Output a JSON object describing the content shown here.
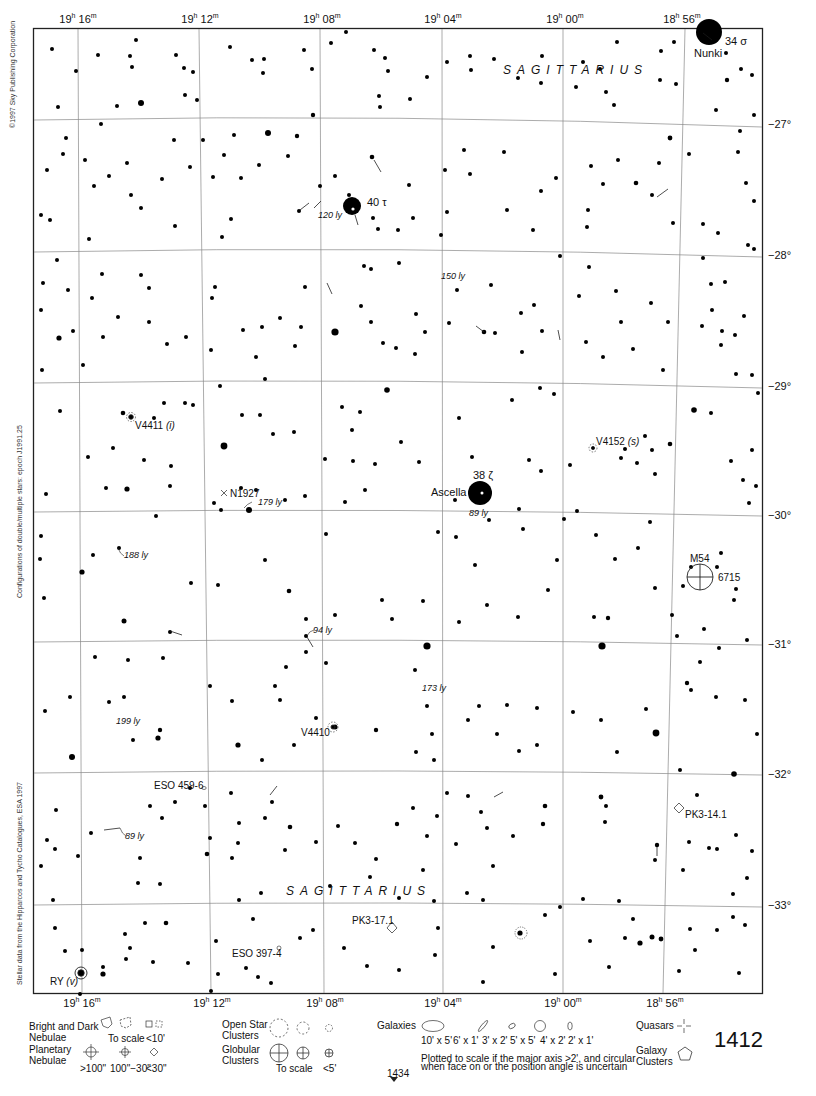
{
  "page": {
    "number": "1412",
    "next_page_ref": "1434"
  },
  "side_notes": {
    "copyright": "©1997 Sky Publishing Corporation",
    "epoch": "Configurations of double/multiple stars: epoch J1991.25",
    "source": "Stellar data from the Hipparcos and Tycho Catalogues, ESA 1997"
  },
  "axes": {
    "ra_top": [
      {
        "h": "19",
        "m": "16",
        "x": 78
      },
      {
        "h": "19",
        "m": "12",
        "x": 200
      },
      {
        "h": "19",
        "m": "08",
        "x": 320
      },
      {
        "h": "19",
        "m": "04",
        "x": 442
      },
      {
        "h": "19",
        "m": "00",
        "x": 563
      },
      {
        "h": "18",
        "m": "56",
        "x": 685
      }
    ],
    "ra_bottom": [
      {
        "h": "19",
        "m": "16",
        "x": 80
      },
      {
        "h": "19",
        "m": "12",
        "x": 210
      },
      {
        "h": "19",
        "m": "08",
        "x": 323
      },
      {
        "h": "19",
        "m": "04",
        "x": 443
      },
      {
        "h": "19",
        "m": "00",
        "x": 563
      },
      {
        "h": "18",
        "m": "56",
        "x": 663
      }
    ],
    "dec": [
      {
        "label": "−27°",
        "y": 126
      },
      {
        "label": "−28°",
        "y": 256
      },
      {
        "label": "−29°",
        "y": 387
      },
      {
        "label": "−30°",
        "y": 516
      },
      {
        "label": "−31°",
        "y": 645
      },
      {
        "label": "−32°",
        "y": 775
      },
      {
        "label": "−33°",
        "y": 906
      }
    ]
  },
  "constellation": {
    "name_top": "SAGITTARIUS",
    "name_bottom": "SAGITTARIUS"
  },
  "labels": {
    "nunki": "Nunki",
    "sigma": "34 σ",
    "tau": "40 τ",
    "zeta": "38 ζ",
    "ascella": "Ascella",
    "ly_120": "120 ly",
    "ly_150": "150 ly",
    "ly_89a": "89 ly",
    "ly_179": "179 ly",
    "ly_188": "188 ly",
    "ly_94": "94 ly",
    "ly_173": "173 ly",
    "ly_199": "199 ly",
    "ly_89b": "89 ly",
    "v4411": "V4411",
    "v4411_type": "(i)",
    "v4152": "V4152",
    "v4152_type": "(s)",
    "n1927": "N1927",
    "m54": "M54",
    "ngc6715": "6715",
    "v4410": "V4410",
    "eso459": "ESO 459-6",
    "pk3_14": "PK3-14.1",
    "pk3_17": "PK3-17.1",
    "eso397": "ESO 397-4",
    "ry": "RY",
    "ry_type": "(v)"
  },
  "legend": {
    "bright_dark_nebulae": "Bright and Dark Nebulae",
    "to_scale": "To scale",
    "lt10": "<10'",
    "planetary_nebulae": "Planetary Nebulae",
    "pn_sizes": [
      ">100\"",
      "100\"−30\"",
      "<30\""
    ],
    "open_clusters": "Open Star Clusters",
    "globular_clusters": "Globular Clusters",
    "gc_to_scale": "To scale",
    "gc_lt5": "<5'",
    "galaxies": "Galaxies",
    "galaxy_sizes": [
      "10' x 5'",
      "6' x 1'",
      "3' x 2'",
      "5' x 5'",
      "4' x 2'",
      "2' x 1'"
    ],
    "galaxy_note_1": "Plotted to scale if the major axis >2', and circular",
    "galaxy_note_2": "when face on or the position angle is uncertain",
    "quasars": "Quasars",
    "galaxy_clusters": "Galaxy Clusters"
  }
}
